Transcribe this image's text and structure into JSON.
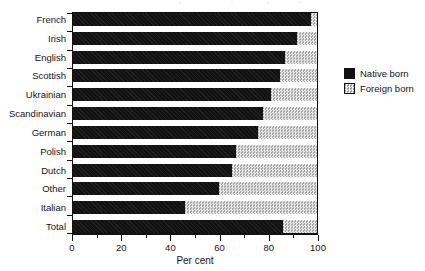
{
  "chart_data": {
    "type": "bar",
    "orientation": "horizontal",
    "stacked": true,
    "title": "",
    "xlabel": "Per cent",
    "ylabel": "",
    "xlim": [
      0,
      100
    ],
    "xticks": [
      0,
      20,
      40,
      60,
      80,
      100
    ],
    "xticklabels": [
      "0",
      "20",
      "40",
      "60",
      "80",
      "100"
    ],
    "minor_tick_step": 10,
    "grid": false,
    "legend_position": "right",
    "categories": [
      "French",
      "Irish",
      "English",
      "Scottish",
      "Ukrainian",
      "Scandinavian",
      "German",
      "Polish",
      "Dutch",
      "Other",
      "Italian",
      "Total"
    ],
    "series": [
      {
        "name": "Native born",
        "color": "#121212",
        "values": [
          97.5,
          92,
          87,
          85,
          81,
          78,
          76,
          67,
          65,
          60,
          46,
          86
        ]
      },
      {
        "name": "Foreign born",
        "color": "#c9c9c9",
        "values": [
          2.5,
          8,
          13,
          15,
          19,
          22,
          24,
          33,
          35,
          40,
          54,
          14
        ]
      }
    ]
  },
  "legend": {
    "items": [
      {
        "label": "Native born",
        "swatch": "black-solid-swatch"
      },
      {
        "label": "Foreign born",
        "swatch": "gray-hatched-swatch"
      }
    ]
  },
  "axis": {
    "x_title": "Per cent",
    "tick_labels": [
      "0",
      "20",
      "40",
      "60",
      "80",
      "100"
    ]
  }
}
